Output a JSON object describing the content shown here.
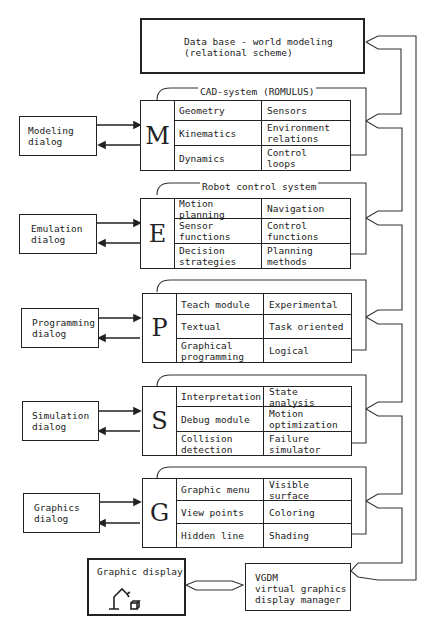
{
  "database": {
    "label": "Data base - world modeling\n(relational scheme)"
  },
  "modules": [
    {
      "id": "M",
      "title": "CAD-system (ROMULUS)",
      "dialog": "Modeling\ndialog",
      "cells": [
        [
          "Geometry",
          "Sensors"
        ],
        [
          "Kinematics",
          "Environment\nrelations"
        ],
        [
          "Dynamics",
          "Control\nloops"
        ]
      ]
    },
    {
      "id": "E",
      "title": "Robot control system",
      "dialog": "Emulation\ndialog",
      "cells": [
        [
          "Motion planning",
          "Navigation"
        ],
        [
          "Sensor\nfunctions",
          "Control\nfunctions"
        ],
        [
          "Decision\nstrategies",
          "Planning\nmethods"
        ]
      ]
    },
    {
      "id": "P",
      "title": "",
      "dialog": "Programming\ndialog",
      "cells": [
        [
          "Teach module",
          "Experimental"
        ],
        [
          "Textual",
          "Task oriented"
        ],
        [
          "Graphical\nprogramming",
          "Logical"
        ]
      ]
    },
    {
      "id": "S",
      "title": "",
      "dialog": "Simulation\ndialog",
      "cells": [
        [
          "Interpretation",
          "State analysis"
        ],
        [
          "Debug module",
          "Motion\noptimization"
        ],
        [
          "Collision\ndetection",
          "Failure\nsimulator"
        ]
      ]
    },
    {
      "id": "G",
      "title": "",
      "dialog": "Graphics\ndialog",
      "cells": [
        [
          "Graphic menu",
          "Visible surface"
        ],
        [
          "View points",
          "Coloring"
        ],
        [
          "Hidden line",
          "Shading"
        ]
      ]
    }
  ],
  "graphic_display": {
    "label": "Graphic display",
    "icon": "robot-arm-icon"
  },
  "vgdm": {
    "label": "VGDM\nvirtual graphics\ndisplay manager"
  }
}
